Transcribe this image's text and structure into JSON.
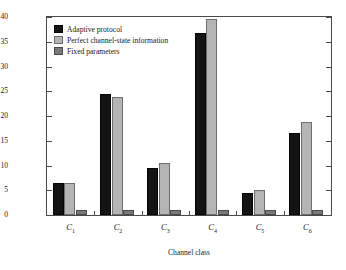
{
  "chart_data": {
    "type": "bar",
    "title": "",
    "xlabel": "Channel class",
    "ylabel": "Normalized throughput efficiency",
    "categories": [
      "C1",
      "C2",
      "C3",
      "C4",
      "C5",
      "C6"
    ],
    "category_labels": [
      "C",
      "C",
      "C",
      "C",
      "C",
      "C"
    ],
    "category_subscripts": [
      "1",
      "2",
      "3",
      "4",
      "5",
      "6"
    ],
    "ylim": [
      0,
      40
    ],
    "yticks": [
      0,
      5,
      10,
      15,
      20,
      25,
      30,
      35,
      40
    ],
    "ytick_labels": [
      "0",
      "5",
      "10",
      "15",
      "20",
      "25",
      "30",
      "35",
      "40"
    ],
    "grid": false,
    "legend_position": "top-left",
    "series": [
      {
        "name": "Adaptive protocol",
        "color": "#141414",
        "values": [
          6.5,
          24.4,
          9.5,
          36.7,
          4.4,
          16.6
        ]
      },
      {
        "name": "Perfect channel-state information",
        "color": "#b4b4b4",
        "values": [
          6.5,
          23.8,
          10.5,
          39.5,
          5.0,
          18.8
        ]
      },
      {
        "name": "Fixed parameters",
        "color": "#7a7a7a",
        "values": [
          1.0,
          1.0,
          1.0,
          1.0,
          1.0,
          1.0
        ]
      }
    ]
  }
}
